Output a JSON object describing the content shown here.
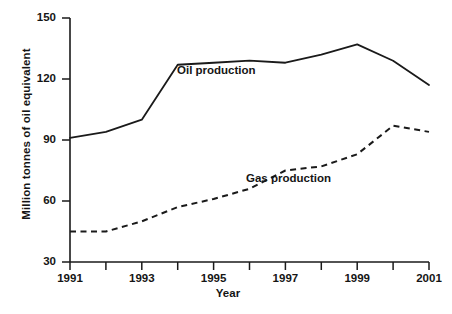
{
  "chart_data": {
    "type": "line",
    "title": "",
    "xlabel": "Year",
    "ylabel": "Million tonnes of oil equivalent",
    "x": [
      1991,
      1992,
      1993,
      1994,
      1995,
      1996,
      1997,
      1998,
      1999,
      2000,
      2001
    ],
    "xlim": [
      1991,
      2001
    ],
    "ylim": [
      30,
      150
    ],
    "yticks": [
      30,
      60,
      90,
      120,
      150
    ],
    "xticks": [
      1991,
      1992,
      1993,
      1994,
      1995,
      1996,
      1997,
      1998,
      1999,
      2000,
      2001
    ],
    "xtick_labels_shown": [
      "1991",
      "1993",
      "1995",
      "1997",
      "1999",
      "2001"
    ],
    "grid": false,
    "legend": "inline-annotations",
    "series": [
      {
        "name": "Oil production",
        "style": "solid",
        "color": "#1a1a1a",
        "values": [
          91,
          94,
          100,
          127,
          128,
          129,
          128,
          132,
          137,
          129,
          117
        ]
      },
      {
        "name": "Gas production",
        "style": "dashed",
        "color": "#1a1a1a",
        "values": [
          45,
          45,
          50,
          57,
          61,
          66,
          75,
          77,
          83,
          97,
          94
        ]
      }
    ],
    "annotations": [
      {
        "text": "Oil production",
        "x": 1994.5,
        "y": 122
      },
      {
        "text": "Gas production",
        "x": 1996.5,
        "y": 67
      }
    ]
  },
  "axis": {
    "y_labels": [
      "150",
      "120",
      "90",
      "60",
      "30"
    ],
    "x_labels": [
      "1991",
      "1993",
      "1995",
      "1997",
      "1999",
      "2001"
    ],
    "y_title": "Million tonnes of oil equivalent",
    "x_title": "Year"
  },
  "labels": {
    "oil": "Oil production",
    "gas": "Gas production"
  },
  "colors": {
    "line": "#1a1a1a",
    "axis": "#1a1a1a",
    "background": "#ffffff"
  }
}
